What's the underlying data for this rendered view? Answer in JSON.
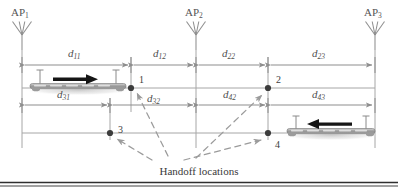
{
  "figure": {
    "caption": "Handoff locations",
    "background_color": "#ffffff",
    "line_color": "#9a9a9a",
    "dark_line_color": "#6e6e6e",
    "text_color": "#4a4a4a",
    "arrow_color": "#1a1a1a",
    "rule_color": "#3a3a3a"
  },
  "access_points": [
    {
      "name": "AP",
      "sub": "1",
      "icon": "antenna-icon",
      "x": 22
    },
    {
      "name": "AP",
      "sub": "2",
      "icon": "antenna-icon",
      "x": 196
    },
    {
      "name": "AP",
      "sub": "3",
      "icon": "antenna-icon",
      "x": 375
    }
  ],
  "dimensions_row_top": [
    {
      "name": "d",
      "sub": "11",
      "from": 22,
      "to": 131
    },
    {
      "name": "d",
      "sub": "12",
      "from": 131,
      "to": 196
    },
    {
      "name": "d",
      "sub": "22",
      "from": 196,
      "to": 268
    },
    {
      "name": "d",
      "sub": "23",
      "from": 268,
      "to": 375
    }
  ],
  "dimensions_row_bottom": [
    {
      "name": "d",
      "sub": "31",
      "from": 22,
      "to": 110
    },
    {
      "name": "d",
      "sub": "32",
      "from": 110,
      "to": 196
    },
    {
      "name": "d",
      "sub": "42",
      "from": 196,
      "to": 268
    },
    {
      "name": "d",
      "sub": "43",
      "from": 268,
      "to": 375
    }
  ],
  "handoff_points": [
    {
      "label": "1",
      "x": 131,
      "y": 88
    },
    {
      "label": "2",
      "x": 268,
      "y": 88
    },
    {
      "label": "3",
      "x": 110,
      "y": 133
    },
    {
      "label": "4",
      "x": 268,
      "y": 133
    }
  ],
  "trains": [
    {
      "id": "train-upper",
      "direction": "right",
      "direction_arrow": "→",
      "x": 28,
      "y": 80,
      "width": 100
    },
    {
      "id": "train-lower",
      "direction": "left",
      "direction_arrow": "←",
      "x": 285,
      "y": 124,
      "width": 90
    }
  ]
}
